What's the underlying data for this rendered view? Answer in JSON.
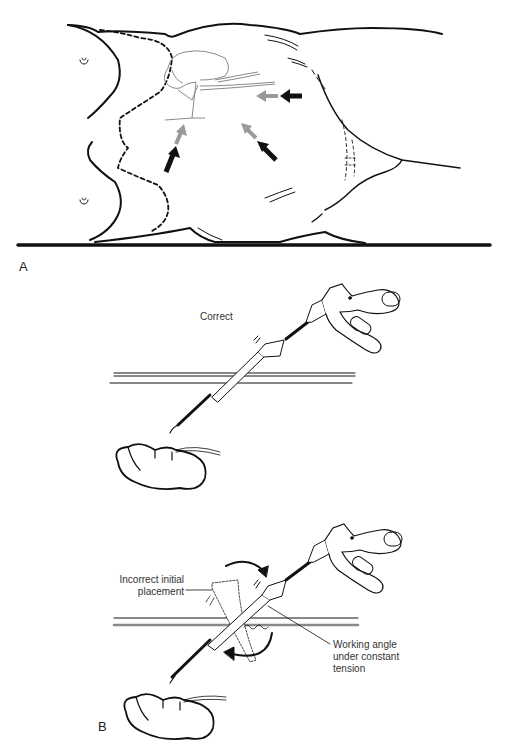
{
  "figure": {
    "panel_a": {
      "label": "A",
      "colors": {
        "outline": "#111111",
        "organ": "#8a8a8a",
        "port_arrow_gray": "#9a9a9a",
        "port_arrow_black": "#111111"
      },
      "arrows": [
        {
          "name": "lateral-port-arrow",
          "direction": "left"
        },
        {
          "name": "lower-left-port-arrow",
          "direction": "up-right"
        },
        {
          "name": "lower-right-port-arrow",
          "direction": "up-left"
        }
      ]
    },
    "panel_b_correct": {
      "caption": "Correct"
    },
    "panel_b": {
      "label": "B",
      "incorrect_label_line1": "Incorrect initial",
      "incorrect_label_line2": "placement",
      "working_label_line1": "Working angle",
      "working_label_line2": "under constant",
      "working_label_line3": "tension"
    }
  }
}
